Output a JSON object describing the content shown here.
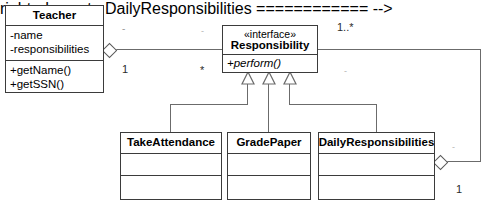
{
  "diagram": {
    "type": "uml-class-diagram",
    "colors": {
      "background": "#ffffff",
      "box_border": "#3b3b3b",
      "connector": "#6b6b6b",
      "text": "#000000",
      "faint_label": "#9a9a9a"
    }
  },
  "classes": {
    "teacher": {
      "name": "Teacher",
      "attributes": [
        "-name",
        "-responsibilities"
      ],
      "operations": [
        "+getName()",
        "+getSSN()"
      ]
    },
    "responsibility": {
      "stereotype": "«interface»",
      "name": "Responsibility",
      "operations": [
        "+perform()"
      ]
    },
    "take_attendance": {
      "name": "TakeAttendance",
      "attributes": [],
      "operations": []
    },
    "grade_paper": {
      "name": "GradePaper",
      "attributes": [],
      "operations": []
    },
    "daily_responsibilities": {
      "name": "DailyResponsibilities",
      "attributes": [],
      "operations": []
    }
  },
  "associations": {
    "teacher_responsibility": {
      "source_role_label": "-",
      "source_multiplicity": "1",
      "target_role_label": "-",
      "target_multiplicity": "*",
      "far_multiplicity": "1..*",
      "aggregation": "hollow-diamond"
    },
    "daily_back_link": {
      "role_label": "-",
      "multiplicity": "1",
      "aggregation": "hollow-diamond"
    },
    "interface_right_label": "-"
  },
  "generalizations": [
    {
      "from": "TakeAttendance",
      "to": "Responsibility",
      "arrow": "hollow-triangle"
    },
    {
      "from": "GradePaper",
      "to": "Responsibility",
      "arrow": "hollow-triangle"
    },
    {
      "from": "DailyResponsibilities",
      "to": "Responsibility",
      "arrow": "hollow-triangle"
    }
  ]
}
